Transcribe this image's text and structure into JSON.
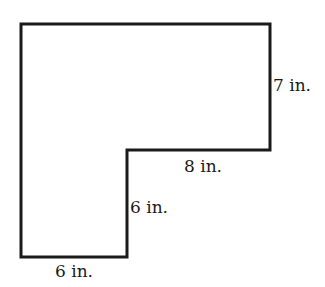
{
  "diagram": {
    "type": "L-shaped polygon (composite rectangle figure)",
    "stroke_color": "#1a1a1a",
    "fill_color": "#ffffff",
    "stroke_width": 3,
    "vertices_px": [
      [
        21,
        24
      ],
      [
        270,
        24
      ],
      [
        270,
        150
      ],
      [
        127,
        150
      ],
      [
        127,
        257
      ],
      [
        21,
        257
      ]
    ],
    "labels": {
      "right_side": "7 in.",
      "inner_horizontal": "8 in.",
      "inner_vertical": "6 in.",
      "bottom": "6 in."
    }
  }
}
